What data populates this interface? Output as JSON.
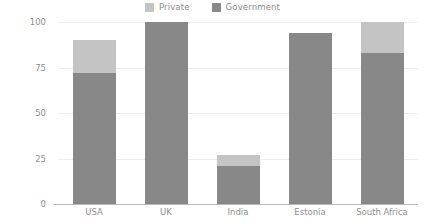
{
  "chart_data": {
    "type": "bar",
    "stacked": true,
    "title": "",
    "xlabel": "",
    "ylabel": "Percentage(%)",
    "ylim": [
      0,
      100
    ],
    "yticks": [
      0,
      25,
      50,
      75,
      100
    ],
    "grid": true,
    "legend_position": "top-center",
    "categories": [
      "USA",
      "UK",
      "India",
      "Estonia",
      "South Africa"
    ],
    "series": [
      {
        "name": "Government",
        "color": "#888888",
        "values": [
          72,
          100,
          21,
          94,
          83
        ]
      },
      {
        "name": "Private",
        "color": "#c4c4c4",
        "values": [
          18,
          0,
          6,
          0,
          17
        ]
      }
    ],
    "totals": [
      90,
      100,
      27,
      94,
      100
    ]
  },
  "legend": {
    "entries": [
      {
        "label": "Private",
        "color": "#c4c4c4",
        "swatch_name": "legend-swatch-private"
      },
      {
        "label": "Government",
        "color": "#888888",
        "swatch_name": "legend-swatch-government"
      }
    ]
  },
  "axes": {
    "y_title": "Percentage(%)",
    "y_ticks": [
      "100",
      "75",
      "50",
      "25",
      "0"
    ],
    "x_ticks": [
      "USA",
      "UK",
      "India",
      "Estonia",
      "South Africa"
    ]
  },
  "colors": {
    "private": "#c4c4c4",
    "government": "#888888",
    "grid": "#eeeeee",
    "axis": "#b9b9b9",
    "text": "#8d8d8d",
    "background": "#ffffff"
  }
}
